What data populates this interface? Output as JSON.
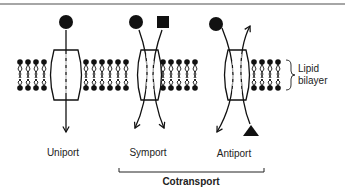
{
  "diagram": {
    "type": "membrane-transport-modes",
    "membrane_label": "Lipid bilayer",
    "membrane_label_lines": [
      "Lipid",
      "bilayer"
    ],
    "transporters": [
      {
        "id": "uniport",
        "label": "Uniport",
        "solutes": [
          "circle"
        ],
        "direction": "single solute in→out"
      },
      {
        "id": "symport",
        "label": "Symport",
        "solutes": [
          "circle",
          "square"
        ],
        "direction": "both solutes same direction"
      },
      {
        "id": "antiport",
        "label": "Antiport",
        "solutes": [
          "circle",
          "triangle"
        ],
        "direction": "solutes opposite directions"
      }
    ],
    "group_label": "Cotransport",
    "group_members": [
      "symport",
      "antiport"
    ]
  }
}
